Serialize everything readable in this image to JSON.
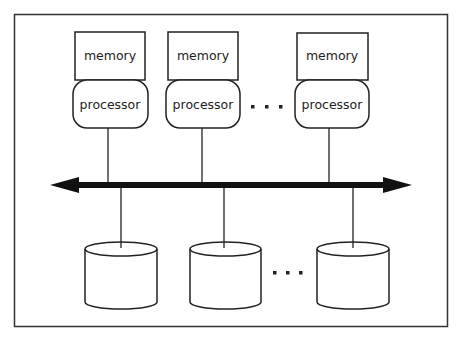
{
  "diagram": {
    "colors": {
      "stroke": "#222222",
      "background": "#ffffff"
    },
    "nodes": [
      {
        "memory_label": "memory",
        "processor_label": "processor"
      },
      {
        "memory_label": "memory",
        "processor_label": "processor"
      },
      {
        "memory_label": "memory",
        "processor_label": "processor"
      }
    ],
    "interconnect": {
      "name": "network-bus",
      "bidirectional": true
    },
    "disks": [
      {
        "name": "disk-1"
      },
      {
        "name": "disk-2"
      },
      {
        "name": "disk-3"
      }
    ],
    "ellipsis_processors": "• • •",
    "ellipsis_disks": "• • •"
  }
}
